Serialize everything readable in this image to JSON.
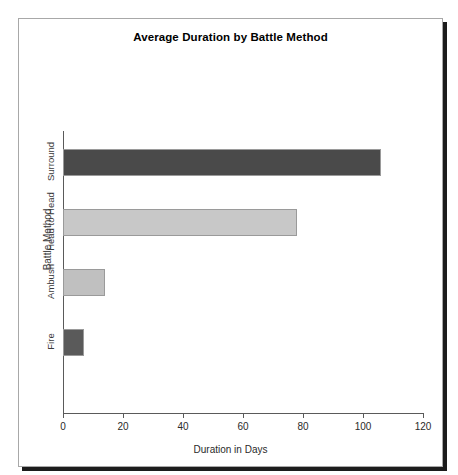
{
  "chart_data": {
    "type": "bar",
    "orientation": "horizontal",
    "title": "Average Duration by Battle Method",
    "xlabel": "Duration in Days",
    "ylabel": "Battle Method",
    "categories": [
      "Fire",
      "Ambush",
      "Head to Head",
      "Surround"
    ],
    "values": [
      7,
      14,
      78,
      106
    ],
    "xlim": [
      0,
      120
    ],
    "xticks": [
      0,
      20,
      40,
      60,
      80,
      100,
      120
    ],
    "xtick_labels": [
      "0",
      "20",
      "40",
      "60",
      "80",
      "100",
      "120"
    ],
    "grid": false,
    "legend": false,
    "bars": [
      {
        "category": "Surround",
        "value": 106,
        "color": "#4a4a4a"
      },
      {
        "category": "Head to Head",
        "value": 78,
        "color": "#c8c8c8"
      },
      {
        "category": "Ambush",
        "value": 14,
        "color": "#c0c0c0"
      },
      {
        "category": "Fire",
        "value": 7,
        "color": "#5a5a5a"
      }
    ]
  },
  "colors": {
    "panel_border": "#a8a8a8",
    "panel_shadow": "#1c1c1c",
    "axis": "#5a5a5a",
    "text": "#000000"
  }
}
